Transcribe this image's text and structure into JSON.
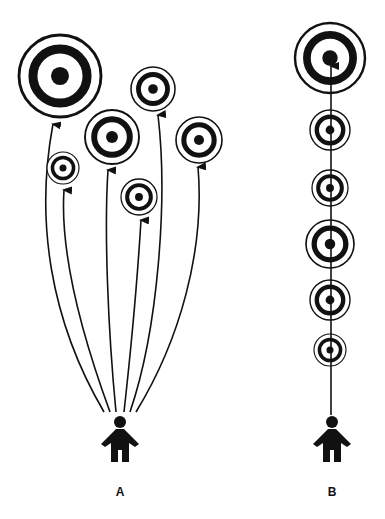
{
  "diagram": {
    "colors": {
      "ink": "#111111",
      "background": "#ffffff"
    },
    "panels": [
      {
        "label": "A",
        "person": {
          "x": 120,
          "y": 422
        },
        "targets": [
          {
            "cx": 60,
            "cy": 76,
            "r": 41
          },
          {
            "cx": 63,
            "cy": 168,
            "r": 16
          },
          {
            "cx": 112,
            "cy": 137,
            "r": 27
          },
          {
            "cx": 139,
            "cy": 197,
            "r": 18
          },
          {
            "cx": 153,
            "cy": 89,
            "r": 22
          },
          {
            "cx": 199,
            "cy": 140,
            "r": 23
          }
        ],
        "arrows": "curved, one per target, originating above person A"
      },
      {
        "label": "B",
        "person": {
          "x": 332,
          "y": 422
        },
        "targets": [
          {
            "cx": 330,
            "cy": 58,
            "r": 35
          },
          {
            "cx": 330,
            "cy": 130,
            "r": 20
          },
          {
            "cx": 330,
            "cy": 188,
            "r": 18
          },
          {
            "cx": 330,
            "cy": 244,
            "r": 24
          },
          {
            "cx": 330,
            "cy": 300,
            "r": 20
          },
          {
            "cx": 330,
            "cy": 350,
            "r": 16
          }
        ],
        "arrows": "single straight line through all targets to the largest"
      }
    ]
  }
}
